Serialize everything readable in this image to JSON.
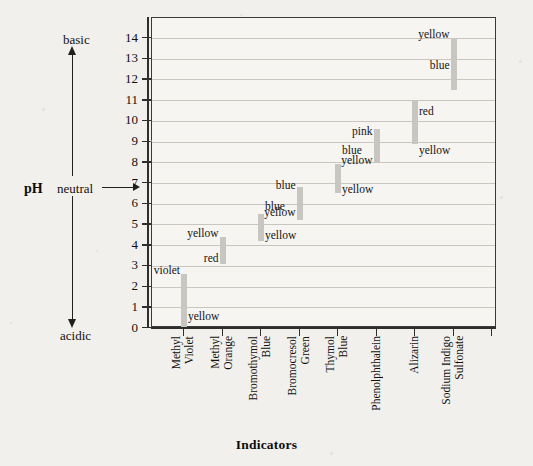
{
  "axis": {
    "y_title": "pH",
    "y_top_label": "basic",
    "y_mid_label": "neutral",
    "y_bottom_label": "acidic",
    "x_title": "Indicators",
    "y_ticks": [
      "14",
      "13",
      "12",
      "11",
      "10",
      "9",
      "8",
      "7",
      "6",
      "5",
      "4",
      "3",
      "2",
      "1",
      "0"
    ],
    "ylim": [
      0,
      14
    ]
  },
  "chart_data": {
    "type": "bar",
    "title": "",
    "xlabel": "Indicators",
    "ylabel": "pH",
    "ylim": [
      0,
      14
    ],
    "grid": true,
    "legend": "none",
    "orientation": "vertical-range-bars",
    "categories": [
      "Methyl Violet",
      "Methyl Orange",
      "Bromothymol Blue",
      "Bromocresol Green",
      "Thymol Blue",
      "Phenolphthalein",
      "Alizarin",
      "Sodium Indigo Sulfonate"
    ],
    "category_labels_wrapped": [
      [
        "Methyl",
        "Violet"
      ],
      [
        "Methyl",
        "Orange"
      ],
      [
        "Bromothymol",
        "Blue"
      ],
      [
        "Bromocresol",
        "Green"
      ],
      [
        "Thymol",
        "Blue"
      ],
      [
        "Phenolphthalein"
      ],
      [
        "Alizarin"
      ],
      [
        "Sodium Indigo",
        "Sulfonate"
      ]
    ],
    "series": [
      {
        "name": "transition range",
        "ranges": [
          {
            "indicator": "Methyl Violet",
            "low": 0.0,
            "high": 2.6,
            "acid_color": "yellow",
            "base_color": "violet"
          },
          {
            "indicator": "Methyl Orange",
            "low": 3.1,
            "high": 4.4,
            "acid_color": "red",
            "base_color": "yellow"
          },
          {
            "indicator": "Bromothymol Blue",
            "low": 4.2,
            "high": 5.5,
            "acid_color": "yellow",
            "base_color": "blue"
          },
          {
            "indicator": "Bromocresol Green",
            "low": 5.2,
            "high": 6.8,
            "acid_color": "yellow",
            "base_color": "blue"
          },
          {
            "indicator": "Thymol Blue",
            "low": 6.5,
            "high": 7.9,
            "acid_color": "yellow",
            "base_color": "blue"
          },
          {
            "indicator": "Phenolphthalein",
            "low": 8.0,
            "high": 9.6,
            "acid_color": "yellow",
            "base_color": "pink"
          },
          {
            "indicator": "Alizarin",
            "low": 8.9,
            "high": 11.0,
            "acid_color": "yellow",
            "base_color": "red"
          },
          {
            "indicator": "Sodium Indigo Sulfonate",
            "low": 11.5,
            "high": 14.0,
            "acid_color": "blue",
            "base_color": "yellow"
          }
        ]
      }
    ],
    "annotations": [
      {
        "text": "yellow",
        "indicator": "Methyl Violet",
        "ph": 0.6,
        "side": "right"
      },
      {
        "text": "violet",
        "indicator": "Methyl Violet",
        "ph": 2.8,
        "side": "left"
      },
      {
        "text": "red",
        "indicator": "Methyl Orange",
        "ph": 3.4,
        "side": "left"
      },
      {
        "text": "yellow",
        "indicator": "Methyl Orange",
        "ph": 4.6,
        "side": "left"
      },
      {
        "text": "yellow",
        "indicator": "Bromothymol Blue",
        "ph": 4.5,
        "side": "right"
      },
      {
        "text": "blue",
        "indicator": "Bromothymol Blue",
        "ph": 5.9,
        "side": "right"
      },
      {
        "text": "yellow",
        "indicator": "Bromocresol Green",
        "ph": 5.6,
        "side": "left"
      },
      {
        "text": "blue",
        "indicator": "Bromocresol Green",
        "ph": 6.9,
        "side": "left"
      },
      {
        "text": "yellow",
        "indicator": "Thymol Blue",
        "ph": 6.7,
        "side": "right"
      },
      {
        "text": "blue",
        "indicator": "Thymol Blue",
        "ph": 8.6,
        "side": "right"
      },
      {
        "text": "yellow",
        "indicator": "Phenolphthalein",
        "ph": 8.1,
        "side": "left"
      },
      {
        "text": "pink",
        "indicator": "Phenolphthalein",
        "ph": 9.5,
        "side": "left"
      },
      {
        "text": "yellow",
        "indicator": "Alizarin",
        "ph": 8.6,
        "side": "right"
      },
      {
        "text": "red",
        "indicator": "Alizarin",
        "ph": 10.5,
        "side": "right"
      },
      {
        "text": "blue",
        "indicator": "Sodium Indigo Sulfonate",
        "ph": 12.7,
        "side": "left"
      },
      {
        "text": "yellow",
        "indicator": "Sodium Indigo Sulfonate",
        "ph": 14.2,
        "side": "left"
      }
    ]
  },
  "colors": {
    "background": "#f2f0ec",
    "plot_background": "#f6f5f1",
    "bar": "#c8c6c1",
    "grid": "#c9c6c0",
    "axis": "#2e2e2e",
    "text": "#101010"
  }
}
